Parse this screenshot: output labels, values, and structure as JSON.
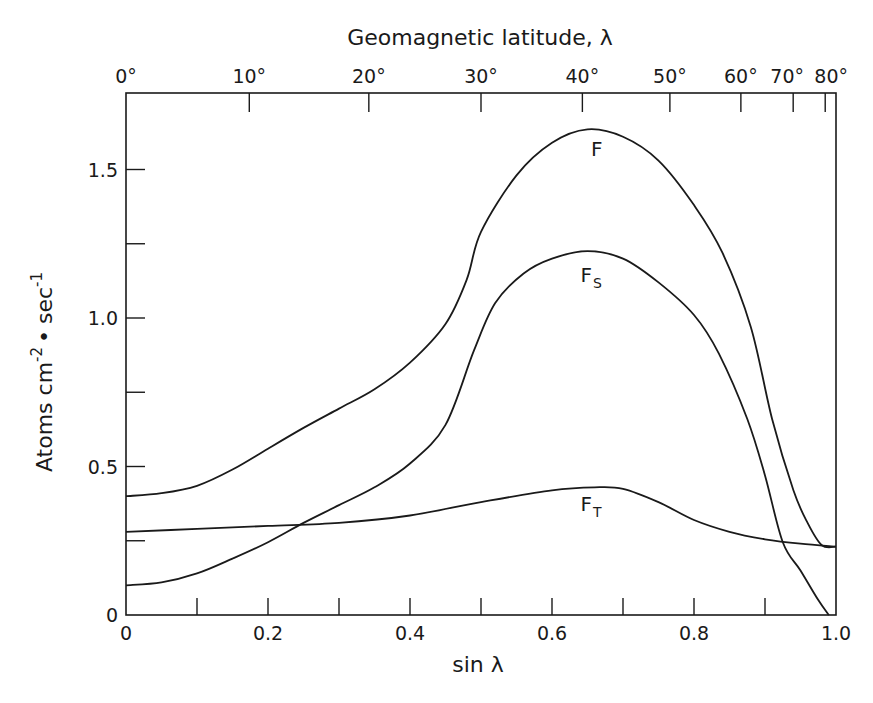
{
  "chart_data": {
    "type": "line",
    "title": "",
    "xlabel": "sin λ",
    "ylabel": "Atoms cm⁻² • sec⁻¹",
    "ylabel_parts": {
      "base": "Atoms cm",
      "exp1": "-2",
      "dot": "•",
      "unit2": "sec",
      "exp2": "-1"
    },
    "top_axis_label": "Geomagnetic latitude, λ",
    "xlim": [
      0,
      1.0
    ],
    "ylim": [
      0,
      1.76
    ],
    "grid": false,
    "legend": "inline labels on curves",
    "x_ticks": [
      0,
      0.1,
      0.2,
      0.3,
      0.4,
      0.5,
      0.6,
      0.7,
      0.8,
      0.9,
      1.0
    ],
    "x_tick_labels": [
      {
        "value": 0,
        "label": "0"
      },
      {
        "value": 0.2,
        "label": "0.2"
      },
      {
        "value": 0.4,
        "label": "0.4"
      },
      {
        "value": 0.6,
        "label": "0.6"
      },
      {
        "value": 0.8,
        "label": "0.8"
      },
      {
        "value": 1.0,
        "label": "1.0"
      }
    ],
    "y_ticks": [
      0,
      0.25,
      0.5,
      0.75,
      1.0,
      1.25,
      1.5
    ],
    "y_tick_labels": [
      {
        "value": 0,
        "label": "0"
      },
      {
        "value": 0.5,
        "label": "0.5"
      },
      {
        "value": 1.0,
        "label": "1.0"
      },
      {
        "value": 1.5,
        "label": "1.5"
      }
    ],
    "top_ticks": [
      {
        "deg": 0,
        "label": "0°"
      },
      {
        "deg": 10,
        "label": "10°"
      },
      {
        "deg": 20,
        "label": "20°"
      },
      {
        "deg": 30,
        "label": "30°"
      },
      {
        "deg": 40,
        "label": "40°"
      },
      {
        "deg": 50,
        "label": "50°"
      },
      {
        "deg": 60,
        "label": "60°"
      },
      {
        "deg": 70,
        "label": "70°"
      },
      {
        "deg": 80,
        "label": "80°"
      }
    ],
    "series": [
      {
        "name": "F",
        "label_main": "F",
        "label_sub": "",
        "label_pos": [
          0.655,
          1.545
        ],
        "x": [
          0,
          0.05,
          0.1,
          0.15,
          0.2,
          0.25,
          0.3,
          0.35,
          0.4,
          0.45,
          0.48,
          0.5,
          0.55,
          0.6,
          0.65,
          0.7,
          0.75,
          0.8,
          0.84,
          0.88,
          0.91,
          0.94,
          0.96,
          0.98,
          1.0
        ],
        "values": [
          0.4,
          0.41,
          0.435,
          0.49,
          0.56,
          0.63,
          0.695,
          0.76,
          0.85,
          0.98,
          1.13,
          1.29,
          1.48,
          1.59,
          1.635,
          1.61,
          1.53,
          1.38,
          1.22,
          0.97,
          0.66,
          0.42,
          0.31,
          0.235,
          0.23
        ]
      },
      {
        "name": "F_S",
        "label_main": "F",
        "label_sub": "S",
        "label_pos": [
          0.64,
          1.12
        ],
        "x": [
          0,
          0.05,
          0.1,
          0.15,
          0.2,
          0.25,
          0.3,
          0.35,
          0.4,
          0.45,
          0.49,
          0.52,
          0.56,
          0.6,
          0.65,
          0.7,
          0.75,
          0.8,
          0.835,
          0.875,
          0.9,
          0.925,
          0.95,
          0.975,
          0.99
        ],
        "values": [
          0.1,
          0.11,
          0.14,
          0.19,
          0.245,
          0.31,
          0.37,
          0.43,
          0.51,
          0.64,
          0.89,
          1.05,
          1.15,
          1.2,
          1.225,
          1.2,
          1.12,
          1.01,
          0.88,
          0.66,
          0.47,
          0.245,
          0.15,
          0.05,
          0.0
        ]
      },
      {
        "name": "F_T",
        "label_main": "F",
        "label_sub": "T",
        "label_pos": [
          0.64,
          0.35
        ],
        "x": [
          0,
          0.1,
          0.2,
          0.3,
          0.4,
          0.5,
          0.6,
          0.66,
          0.7,
          0.75,
          0.8,
          0.85,
          0.9,
          0.95,
          1.0
        ],
        "values": [
          0.28,
          0.29,
          0.3,
          0.31,
          0.335,
          0.38,
          0.42,
          0.43,
          0.425,
          0.38,
          0.32,
          0.28,
          0.255,
          0.24,
          0.23
        ]
      }
    ]
  }
}
